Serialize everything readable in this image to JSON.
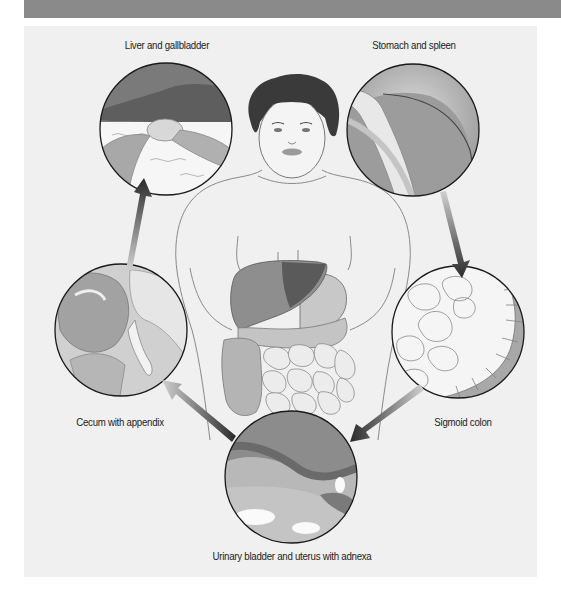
{
  "figure": {
    "type": "anatomical-diagram",
    "colors": {
      "header_bar": "#8a8a8a",
      "panel_bg": "#f0f0f0",
      "circle_border": "#1a1a1a",
      "arrow_dark": "#2a2a2a",
      "arrow_light": "#c8c8c8",
      "organ_dark": "#6e6e6e",
      "organ_mid": "#9a9a9a",
      "organ_light": "#d8d8d8"
    }
  },
  "labels": {
    "liver": "Liver and gallbladder",
    "stomach": "Stomach and spleen",
    "sigmoid": "Sigmoid colon",
    "bladder": "Urinary bladder and uterus with adnexa",
    "cecum": "Cecum with appendix"
  },
  "sequence": [
    {
      "from": "Liver and gallbladder",
      "to": "Stomach and spleen"
    },
    {
      "from": "Stomach and spleen",
      "to": "Sigmoid colon"
    },
    {
      "from": "Sigmoid colon",
      "to": "Urinary bladder and uterus with adnexa"
    },
    {
      "from": "Urinary bladder and uterus with adnexa",
      "to": "Cecum with appendix"
    },
    {
      "from": "Cecum with appendix",
      "to": "Liver and gallbladder"
    }
  ]
}
